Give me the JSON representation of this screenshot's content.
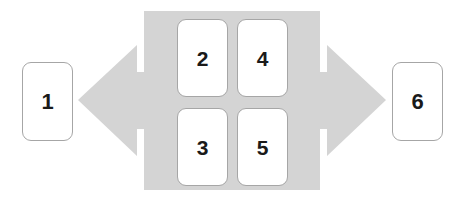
{
  "diagram": {
    "type": "bidirectional-arrow-process",
    "colors": {
      "arrow_fill": "#d4d4d4",
      "panel_fill": "#d4d4d4",
      "box_fill": "#ffffff",
      "box_border": "#a6a6a6",
      "label_color": "#1a1a1a",
      "background": "#ffffff"
    },
    "center_panel": {
      "name": "center-panel",
      "x": 144,
      "y": 11,
      "width": 176,
      "height": 179
    },
    "arrow_left": {
      "name": "left-arrow",
      "direction": "left",
      "tip_x": 78,
      "tip_y": 100
    },
    "arrow_right": {
      "name": "right-arrow",
      "direction": "right",
      "tip_x": 386,
      "tip_y": 100
    },
    "outer_nodes": [
      {
        "id": "node-1",
        "label": "1",
        "position": "left"
      },
      {
        "id": "node-6",
        "label": "6",
        "position": "right"
      }
    ],
    "inner_nodes": [
      {
        "id": "node-2",
        "label": "2",
        "row": "top",
        "column": "left"
      },
      {
        "id": "node-4",
        "label": "4",
        "row": "top",
        "column": "right"
      },
      {
        "id": "node-3",
        "label": "3",
        "row": "bottom",
        "column": "left"
      },
      {
        "id": "node-5",
        "label": "5",
        "row": "bottom",
        "column": "right"
      }
    ]
  }
}
